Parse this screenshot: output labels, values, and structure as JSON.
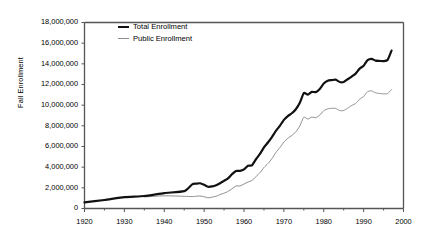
{
  "chart_data": {
    "type": "line",
    "title": "",
    "xlabel": "",
    "ylabel": "Fall Enrollment",
    "xlim": [
      1920,
      2000
    ],
    "ylim": [
      0,
      18000000
    ],
    "grid": false,
    "legend_position": "top-left-inside",
    "x_ticks": [
      "1920",
      "1930",
      "1940",
      "1950",
      "1960",
      "1970",
      "1980",
      "1990",
      "2000"
    ],
    "x_tick_values": [
      1920,
      1930,
      1940,
      1950,
      1960,
      1970,
      1980,
      1990,
      2000
    ],
    "x_minor_tick_values": [
      1925,
      1935,
      1945,
      1955,
      1965,
      1975,
      1985,
      1995
    ],
    "y_ticks": [
      "0",
      "2,000,000",
      "4,000,000",
      "6,000,000",
      "8,000,000",
      "10,000,000",
      "12,000,000",
      "14,000,000",
      "16,000,000",
      "18,000,000"
    ],
    "y_tick_values": [
      0,
      2000000,
      4000000,
      6000000,
      8000000,
      10000000,
      12000000,
      14000000,
      16000000,
      18000000
    ],
    "colors": {
      "total": "#111111",
      "public": "#8d8d8d",
      "axis": "#555555"
    },
    "series": [
      {
        "name": "Total Enrollment",
        "color": "#111111",
        "line_width": 2.2,
        "x": [
          1920,
          1925,
          1930,
          1935,
          1940,
          1945,
          1947,
          1948,
          1949,
          1950,
          1951,
          1952,
          1953,
          1954,
          1955,
          1956,
          1957,
          1958,
          1959,
          1960,
          1961,
          1962,
          1963,
          1964,
          1965,
          1966,
          1967,
          1968,
          1969,
          1970,
          1971,
          1972,
          1973,
          1974,
          1975,
          1976,
          1977,
          1978,
          1979,
          1980,
          1981,
          1982,
          1983,
          1984,
          1985,
          1986,
          1987,
          1988,
          1989,
          1990,
          1991,
          1992,
          1993,
          1994,
          1995,
          1996,
          1997
        ],
        "values": [
          598000,
          820000,
          1101000,
          1208000,
          1494000,
          1677000,
          2338000,
          2403000,
          2445000,
          2297000,
          2102000,
          2134000,
          2250000,
          2447000,
          2679000,
          2918000,
          3324000,
          3639000,
          3640000,
          3789000,
          4145000,
          4175000,
          4766000,
          5280000,
          5921000,
          6390000,
          6912000,
          7513000,
          8005000,
          8581000,
          8949000,
          9215000,
          9602000,
          10224000,
          11185000,
          11012000,
          11286000,
          11260000,
          11570000,
          12097000,
          12372000,
          12426000,
          12465000,
          12242000,
          12247000,
          12504000,
          12767000,
          13055000,
          13539000,
          13819000,
          14359000,
          14487000,
          14305000,
          14279000,
          14262000,
          14368000,
          15280000
        ]
      },
      {
        "name": "Public Enrollment",
        "color": "#8d8d8d",
        "line_width": 1.0,
        "x": [
          1935,
          1940,
          1945,
          1947,
          1948,
          1949,
          1950,
          1951,
          1952,
          1953,
          1954,
          1955,
          1956,
          1957,
          1958,
          1959,
          1960,
          1961,
          1962,
          1963,
          1964,
          1965,
          1966,
          1967,
          1968,
          1969,
          1970,
          1971,
          1972,
          1973,
          1974,
          1975,
          1976,
          1977,
          1978,
          1979,
          1980,
          1981,
          1982,
          1983,
          1984,
          1985,
          1986,
          1987,
          1988,
          1989,
          1990,
          1991,
          1992,
          1993,
          1994,
          1995,
          1996,
          1997
        ],
        "values": [
          1120000,
          1230000,
          1180000,
          1153000,
          1186000,
          1208000,
          1139000,
          1037000,
          1101000,
          1185000,
          1354000,
          1476000,
          1656000,
          1909000,
          2181000,
          2181000,
          2366000,
          2561000,
          2719000,
          3081000,
          3468000,
          3970000,
          4349000,
          4816000,
          5431000,
          5897000,
          6428000,
          6804000,
          7071000,
          7420000,
          7989000,
          8835000,
          8653000,
          8847000,
          8786000,
          9037000,
          9457000,
          9647000,
          9696000,
          9683000,
          9477000,
          9479000,
          9714000,
          9974000,
          10161000,
          10578000,
          10845000,
          11310000,
          11385000,
          11189000,
          11134000,
          11092000,
          11121000,
          11500000
        ]
      }
    ],
    "annotations": []
  },
  "legend": {
    "items": [
      {
        "label": "Total Enrollment"
      },
      {
        "label": "Public Enrollment"
      }
    ]
  },
  "axes": {
    "y_title": "Fall Enrollment"
  }
}
